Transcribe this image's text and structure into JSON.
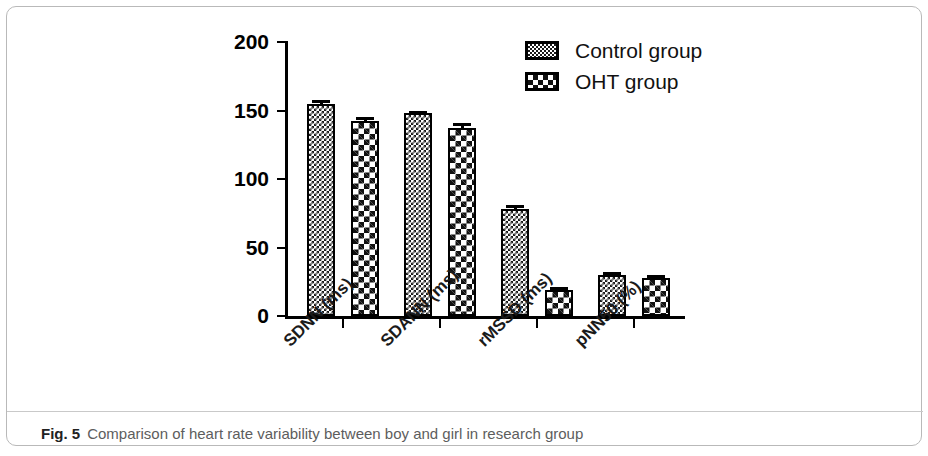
{
  "figure": {
    "caption_label": "Fig. 5",
    "caption_text": "Comparison of heart rate variability between boy and girl in research group"
  },
  "legend": {
    "position": "top-right",
    "entries": [
      {
        "label": "Control group",
        "pattern": "dense-checker"
      },
      {
        "label": "OHT group",
        "pattern": "coarse-checker"
      }
    ]
  },
  "axes": {
    "y_ticks": [
      "0",
      "50",
      "100",
      "150",
      "200"
    ],
    "y_min": 0,
    "y_max": 200
  },
  "chart_data": {
    "type": "bar",
    "title": "",
    "subtitle": "",
    "xlabel": "",
    "ylabel": "",
    "ylim": [
      0,
      200
    ],
    "yticks": [
      0,
      50,
      100,
      150,
      200
    ],
    "grid": false,
    "legend_position": "top-right",
    "categories": [
      "SDNN (ms)",
      "SDANN (ms)",
      "rMSSD (ms)",
      "pNN50 (%)"
    ],
    "series": [
      {
        "name": "Control group",
        "values": [
          155,
          148,
          78,
          30
        ],
        "errors": [
          3,
          2,
          3,
          2
        ]
      },
      {
        "name": "OHT group",
        "values": [
          142,
          137,
          19,
          28
        ],
        "errors": [
          3,
          4,
          2,
          2
        ]
      }
    ]
  }
}
